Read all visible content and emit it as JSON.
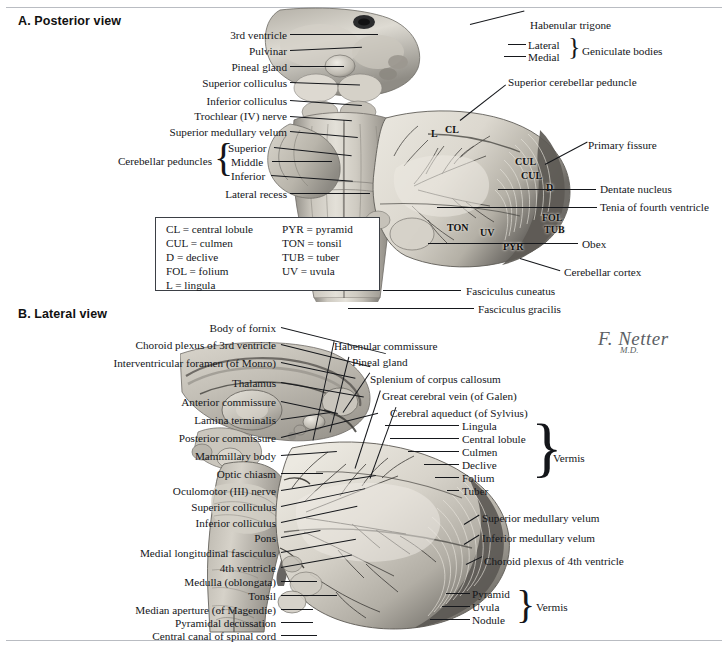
{
  "figure": {
    "signature_name": "F. Netter",
    "signature_suffix": "M.D."
  },
  "panel_a": {
    "title": "A. Posterior view",
    "labels_left": [
      {
        "text": "3rd ventricle"
      },
      {
        "text": "Pulvinar"
      },
      {
        "text": "Pineal gland"
      },
      {
        "text": "Superior colliculus"
      },
      {
        "text": "Inferior colliculus"
      },
      {
        "text": "Trochlear (IV) nerve"
      },
      {
        "text": "Superior medullary velum"
      },
      {
        "text": "Lateral recess"
      }
    ],
    "peduncles_group": {
      "label": "Cerebellar peduncles",
      "items": [
        "Superior",
        "Middle",
        "Inferior"
      ]
    },
    "labels_right": [
      {
        "text": "Habenular trigone"
      },
      {
        "text": "Superior cerebellar peduncle"
      },
      {
        "text": "Primary fissure"
      },
      {
        "text": "Dentate nucleus"
      },
      {
        "text": "Tenia of fourth ventricle"
      },
      {
        "text": "Obex"
      },
      {
        "text": "Cerebellar cortex"
      },
      {
        "text": "Fasciculus cuneatus"
      },
      {
        "text": "Fasciculus gracilis"
      }
    ],
    "geniculate_group": {
      "label": "Geniculate bodies",
      "items": [
        "Lateral",
        "Medial"
      ]
    },
    "abbreviations_on_art": [
      "L",
      "CL",
      "CUL",
      "CUL",
      "D",
      "TON",
      "UV",
      "FOL",
      "TUB",
      "PYR"
    ],
    "legend": [
      {
        "abbr": "CL",
        "term": "CL = central lobule"
      },
      {
        "abbr": "PYR",
        "term": "PYR = pyramid"
      },
      {
        "abbr": "CUL",
        "term": "CUL = culmen"
      },
      {
        "abbr": "TON",
        "term": "TON = tonsil"
      },
      {
        "abbr": "D",
        "term": "D = declive"
      },
      {
        "abbr": "TUB",
        "term": "TUB = tuber"
      },
      {
        "abbr": "FOL",
        "term": "FOL = folium"
      },
      {
        "abbr": "UV",
        "term": "UV = uvula"
      },
      {
        "abbr": "L",
        "term": "L = lingula"
      },
      {
        "abbr": "",
        "term": ""
      }
    ]
  },
  "panel_b": {
    "title": "B. Lateral view",
    "labels_left": [
      {
        "text": "Body of fornix"
      },
      {
        "text": "Choroid plexus of 3rd ventricle"
      },
      {
        "text": "Interventricular foramen (of Monro)"
      },
      {
        "text": "Thalamus"
      },
      {
        "text": "Anterior commissure"
      },
      {
        "text": "Lamina terminalis"
      },
      {
        "text": "Posterior commissure"
      },
      {
        "text": "Mammillary body"
      },
      {
        "text": "Optic chiasm"
      },
      {
        "text": "Oculomotor (III) nerve"
      },
      {
        "text": "Superior colliculus"
      },
      {
        "text": "Inferior colliculus"
      },
      {
        "text": "Pons"
      },
      {
        "text": "Medial longitudinal fasciculus"
      },
      {
        "text": "4th ventricle"
      },
      {
        "text": "Medulla (oblongata)"
      },
      {
        "text": "Tonsil"
      },
      {
        "text": "Median aperture (of Magendie)"
      },
      {
        "text": "Pyramidal decussation"
      },
      {
        "text": "Central canal of spinal cord"
      }
    ],
    "labels_right_top": [
      {
        "text": "Habenular commissure"
      },
      {
        "text": "Pineal gland"
      },
      {
        "text": "Splenium of corpus callosum"
      },
      {
        "text": "Great cerebral vein (of Galen)"
      },
      {
        "text": "Cerebral aqueduct (of Sylvius)"
      }
    ],
    "vermis_group_upper": {
      "label": "Vermis",
      "items": [
        "Lingula",
        "Central lobule",
        "Culmen",
        "Declive",
        "Folium",
        "Tuber"
      ]
    },
    "labels_right_mid": [
      {
        "text": "Superior medullary velum"
      },
      {
        "text": "Inferior medullary velum"
      },
      {
        "text": "Choroid plexus of 4th ventricle"
      }
    ],
    "vermis_group_lower": {
      "label": "Vermis",
      "items": [
        "Pyramid",
        "Uvula",
        "Nodule"
      ]
    }
  }
}
